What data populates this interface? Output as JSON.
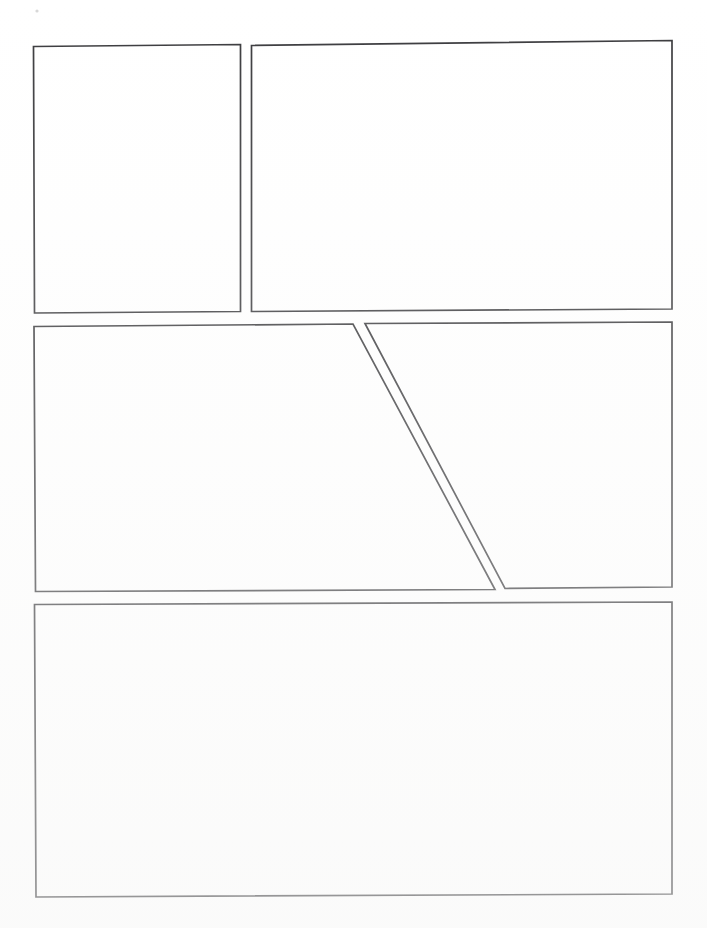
{
  "page": {
    "width": 707,
    "height": 928,
    "background_color": "#ffffff",
    "ink_color": "#3a3a3d",
    "panel_fill_color": "#ffffff",
    "panel_count": 5,
    "row_count": 3,
    "visible_text": ""
  },
  "rows": [
    {
      "name": "row-top",
      "panel_count": 2
    },
    {
      "name": "row-middle",
      "panel_count": 2,
      "note": "split by diagonal gutter"
    },
    {
      "name": "row-bottom",
      "panel_count": 1
    }
  ],
  "panels": [
    {
      "id": "panel-1",
      "label": "",
      "row": 1,
      "position": "top-left",
      "shape": "rectangle",
      "points": "33.5,46.5 240.5,44.5 240.5,311.5 34.5,313.0",
      "bbox": {
        "x": 33,
        "y": 44,
        "w": 208,
        "h": 270
      }
    },
    {
      "id": "panel-2",
      "label": "",
      "row": 1,
      "position": "top-right",
      "shape": "rectangle",
      "points": "251.5,45.5 672.0,40.5 672.0,309.0 251.5,311.5",
      "bbox": {
        "x": 251,
        "y": 40,
        "w": 421,
        "h": 272
      }
    },
    {
      "id": "panel-3",
      "label": "",
      "row": 2,
      "position": "middle-left",
      "shape": "right-trapezoid",
      "points": "34.0,326.5 353.0,324.0 495.0,589.5 35.5,591.5",
      "bbox": {
        "x": 34,
        "y": 324,
        "w": 461,
        "h": 268
      }
    },
    {
      "id": "panel-4",
      "label": "",
      "row": 2,
      "position": "middle-right",
      "shape": "left-trapezoid",
      "points": "365.0,323.5 672.0,322.0 672.0,587.0 505.0,588.5",
      "bbox": {
        "x": 365,
        "y": 322,
        "w": 307,
        "h": 267
      }
    },
    {
      "id": "panel-5",
      "label": "",
      "row": 3,
      "position": "bottom-full",
      "shape": "rectangle",
      "points": "34.5,604.5 672.0,602.0 672.0,894.0 36.0,897.0",
      "bbox": {
        "x": 34,
        "y": 602,
        "w": 638,
        "h": 295
      }
    }
  ],
  "gutters": [
    {
      "name": "gutter-top-vertical",
      "orientation": "vertical",
      "between": [
        "panel-1",
        "panel-2"
      ],
      "width_px": 11
    },
    {
      "name": "gutter-row1-row2",
      "orientation": "horizontal",
      "between": [
        "row-top",
        "row-middle"
      ],
      "width_px": 13
    },
    {
      "name": "gutter-middle-diagonal",
      "orientation": "diagonal",
      "between": [
        "panel-3",
        "panel-4"
      ],
      "width_px": 11
    },
    {
      "name": "gutter-row2-row3",
      "orientation": "horizontal",
      "between": [
        "row-middle",
        "row-bottom"
      ],
      "width_px": 13
    }
  ],
  "marks": [
    {
      "name": "scan-speck-top-left",
      "x": 37,
      "y": 11,
      "r": 1.6,
      "color": "#d8d8d8"
    }
  ]
}
